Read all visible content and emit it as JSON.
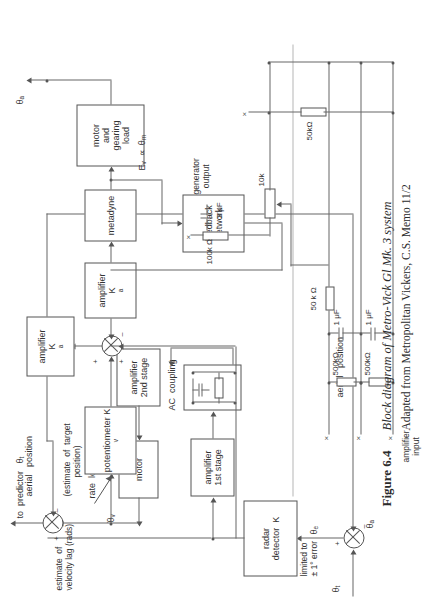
{
  "figure": {
    "number": "Figure 6.4",
    "title": "Block diagram of Metro-Vick Gl Mk. 3 system",
    "source": "Adapted from Metropolitan Vickers, C.S. Memo 11/2"
  },
  "blocks": {
    "radar_detector": "radar\ndetector  K",
    "amplifier_1st": "amplifier\n1st stage",
    "ac_coupling_box": "",
    "amplifier_2nd": "amplifier\n2nd stage",
    "motor": "motor",
    "potentiometer": "potentiometer\nK",
    "potentiometer_sub": "v",
    "amplifier_ka": "amplifier\nK",
    "amplifier_ka_sub": "a",
    "metadyne": "metadyne",
    "motor_gearing": "motor\nand\ngearing\nload",
    "feedback_network": "feedback\nnetwork"
  },
  "labels": {
    "theta_t": "θ",
    "theta_t_sub": "t",
    "theta_a_bottom": "θ",
    "theta_a_bottom_sub": "a",
    "theta_e": "θ",
    "theta_e_sub": "e",
    "theta_a_top": "θ",
    "theta_a_top_sub": "a",
    "theta_v_dot": "θ",
    "theta_v_dot_sub": "v",
    "limited_error": "limited to\n± 1° error",
    "ac_coupling": "AC  coupling",
    "rate_lock": "rate  lock",
    "estimate_velocity": "estimate  of\nvelocity lag (rads)",
    "to_predictor": "to  predictor   θ",
    "to_predictor_sub": "t",
    "aerial_position_top": "aerial   position",
    "estimate_target": "(estimate  of  target\n        position)",
    "aerial_position_mid": "aerial   position",
    "ev_theta_m": "E",
    "ev_theta_m_sub": "v",
    "ev_theta_m_rest": "  ∝  θ",
    "ev_theta_m_sub2": "m",
    "plus": "+",
    "minus": "–"
  },
  "circuit": {
    "caption": "typical  feedback  network",
    "amplifier_input": "amplifier\ninput",
    "generator_output": "generator\noutput",
    "r_100k": "100k Ω",
    "c_3uf": "3 μF",
    "r_10k": "10k",
    "r_50k_left": "50 k Ω",
    "c_1uf_a": "1 μF",
    "c_1uf_b": "1 μF",
    "r_500k_a": "500kΩ",
    "r_500k_b": "500kΩ",
    "r_50k_right": "50kΩ",
    "terminal_mark": "×"
  },
  "colors": {
    "ink": "#333333",
    "line": "#666666",
    "paper": "#ffffff"
  }
}
